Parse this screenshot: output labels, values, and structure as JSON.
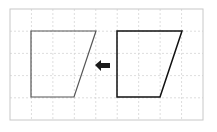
{
  "diagram": {
    "grid": {
      "x0": 10,
      "y0": 9,
      "x1": 203,
      "y1": 120,
      "columns": 9,
      "rows": 5,
      "line_color": "#d4d4d4",
      "border_color": "#c8c8c8"
    },
    "shapes": [
      {
        "name": "left-trapezoid",
        "points": "31,31 96,31 74,97 31,97",
        "stroke": "#555555",
        "stroke_width": 1.2
      },
      {
        "name": "right-trapezoid",
        "points": "117,31 182,31 160,97 117,97",
        "stroke": "#111111",
        "stroke_width": 1.5
      }
    ],
    "arrow": {
      "direction": "left",
      "color": "#1a1a1a",
      "points": "95,65 101,60 101,63 110,63 110,68 101,68 101,71"
    }
  }
}
